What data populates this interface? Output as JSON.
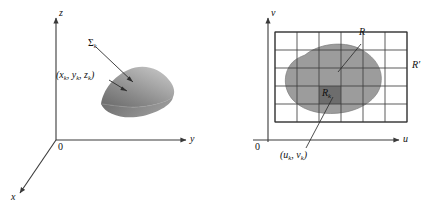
{
  "figure": {
    "background_color": "#ffffff",
    "line_color": "#3a3a3a",
    "surface_fill_light": "#b9b9b9",
    "surface_fill_dark": "#767676",
    "region_fill": "#9a9a9a",
    "cell_fill": "#6d6d6d",
    "grid_color": "#4a4a4a"
  },
  "left_panel": {
    "name": "xyz-space-diagram",
    "axes": [
      {
        "id": "z",
        "label": "z",
        "direction": "up"
      },
      {
        "id": "y",
        "label": "y",
        "direction": "right"
      },
      {
        "id": "x",
        "label": "x",
        "direction": "down-left"
      }
    ],
    "origin_label": "0",
    "surface": {
      "name": "surface-patch",
      "label": "Σ",
      "label_sub": "k"
    },
    "sample_point": {
      "name": "sample-point-label",
      "text": "(x",
      "sub1": "k",
      "text2": ", y",
      "sub2": "k",
      "text3": ", z",
      "sub3": "k",
      "text4": ")"
    }
  },
  "right_panel": {
    "name": "uv-parameter-diagram",
    "axes": [
      {
        "id": "v",
        "label": "v",
        "direction": "up"
      },
      {
        "id": "u",
        "label": "u",
        "direction": "right"
      }
    ],
    "origin_label": "0",
    "region": {
      "name": "region-R",
      "label": "R"
    },
    "enclosing_rect": {
      "name": "region-R-prime",
      "label": "R",
      "prime": "′"
    },
    "cell": {
      "name": "grid-cell-Rk",
      "label": "R",
      "label_sub": "k"
    },
    "sample_point": {
      "name": "sample-point-label-uv",
      "text": "(u",
      "sub1": "k",
      "text2": ", v",
      "sub2": "k",
      "text3": ")"
    },
    "grid": {
      "columns": 6,
      "rows": 5,
      "highlight_col": 3,
      "highlight_row": 3
    }
  }
}
